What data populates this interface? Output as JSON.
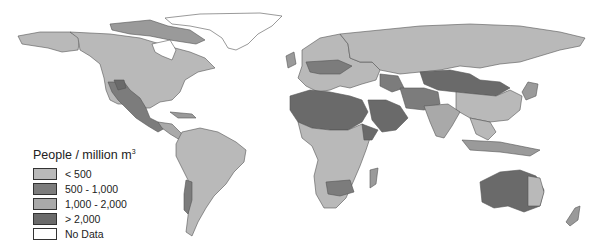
{
  "map": {
    "title": "People / million m",
    "title_superscript": "3",
    "legend": [
      {
        "label": "< 500",
        "color": "#b9b9b9"
      },
      {
        "label": "500 - 1,000",
        "color": "#7c7c7c"
      },
      {
        "label": "1,000 - 2,000",
        "color": "#a9a9a9"
      },
      {
        "label": "> 2,000",
        "color": "#6a6a6a"
      },
      {
        "label": "No Data",
        "color": "#ffffff"
      }
    ],
    "colors": {
      "low": "#b9b9b9",
      "mid": "#7c7c7c",
      "midhigh": "#a9a9a9",
      "high": "#6a6a6a",
      "border": "#555555",
      "background": "#ffffff"
    }
  }
}
